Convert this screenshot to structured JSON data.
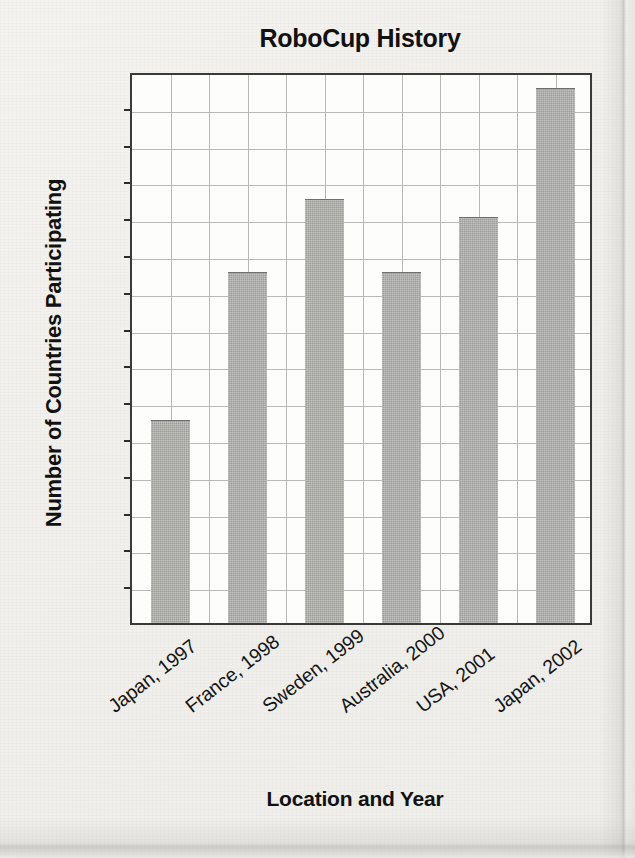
{
  "chart_data": {
    "type": "bar",
    "title": "RoboCup History",
    "xlabel": "Location and Year",
    "ylabel": "Number of Countries Participating",
    "categories": [
      "Japan, 1997",
      "France, 1998",
      "Sweden, 1999",
      "Australia, 2000",
      "USA, 2001",
      "Japan, 2002"
    ],
    "values": [
      11,
      19,
      23,
      19,
      22,
      29
    ],
    "ylim": [
      0,
      30
    ],
    "ytick_step": 2,
    "yticks": [
      0,
      2,
      4,
      6,
      8,
      10,
      12,
      14,
      16,
      18,
      20,
      22,
      24,
      26,
      28,
      30
    ],
    "ytick_labels": [
      "0",
      "2",
      "4",
      "6",
      "8",
      "10",
      "12",
      "14",
      "16",
      "18",
      "20",
      "22",
      "24",
      "26",
      "28",
      "30"
    ],
    "grid": true,
    "legend": false,
    "bar_color": "#9c9c99",
    "frame_color": "#3a3a38",
    "grid_color": "#b9b9b6",
    "background": "#fdfdfc",
    "page_background": "#f2f1ee",
    "series": [
      {
        "name": "Number of Countries Participating",
        "values": [
          11,
          19,
          23,
          19,
          22,
          29
        ]
      }
    ]
  }
}
